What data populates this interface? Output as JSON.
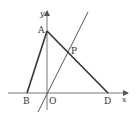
{
  "diagram": {
    "type": "coordinate-geometry",
    "axes": {
      "x_label": "x",
      "y_label": "y",
      "origin_label": "O",
      "color": "#777777"
    },
    "points": {
      "A": {
        "label": "A"
      },
      "B": {
        "label": "B"
      },
      "D": {
        "label": "D"
      },
      "P": {
        "label": "P"
      }
    },
    "segments": [
      "AB",
      "AD"
    ],
    "lines": [
      "line through O and P"
    ],
    "colors": {
      "triangle": "#333333",
      "line": "#555555"
    }
  }
}
